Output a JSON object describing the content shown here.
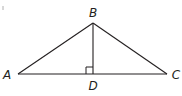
{
  "diagram": {
    "type": "geometry-triangle",
    "stroke_color": "#231f20",
    "points": {
      "A": {
        "x": 18,
        "y": 74
      },
      "B": {
        "x": 93,
        "y": 23
      },
      "C": {
        "x": 167,
        "y": 74
      },
      "D": {
        "x": 93,
        "y": 74
      }
    },
    "labels": {
      "A": "A",
      "B": "B",
      "C": "C",
      "D": "D"
    },
    "segments": [
      "AB",
      "BC",
      "AC",
      "BD"
    ],
    "right_angle_at": "D",
    "right_angle_between": [
      "BD",
      "AD"
    ]
  }
}
